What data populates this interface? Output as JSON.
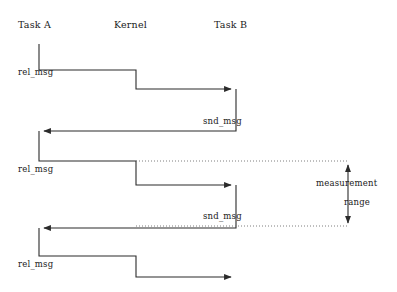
{
  "diagram": {
    "title_columns": [
      {
        "label": "Task A",
        "x": 18,
        "y": 20
      },
      {
        "label": "Kernel",
        "x": 114,
        "y": 20
      },
      {
        "label": "Task B",
        "x": 214,
        "y": 20
      }
    ],
    "lifelines": {
      "task_a_x": 39,
      "kernel_x": 136,
      "task_b_x": 236
    },
    "messages": [
      {
        "name": "rel_msg",
        "label": "rel_msg",
        "x": 18,
        "y": 67
      },
      {
        "name": "snd_msg",
        "label": "snd_msg",
        "x": 203,
        "y": 116
      },
      {
        "name": "rel_msg",
        "label": "rel_msg",
        "x": 18,
        "y": 164
      },
      {
        "name": "snd_msg",
        "label": "snd_msg",
        "x": 203,
        "y": 211
      },
      {
        "name": "rel_msg",
        "label": "rel_msg",
        "x": 18,
        "y": 259
      }
    ],
    "measurement": {
      "line1": "measurement",
      "line2": "range",
      "line1_x": 316,
      "line1_y": 178,
      "line2_x": 344,
      "line2_y": 197,
      "arrow_x": 348,
      "arrow_top_y": 161,
      "arrow_bottom_y": 227
    },
    "guides": [
      {
        "name": "dotted-guide-top",
        "y": 161,
        "x1": 136,
        "x2": 348
      },
      {
        "name": "dotted-guide-bottom",
        "y": 226,
        "x1": 136,
        "x2": 348
      }
    ],
    "colors": {
      "line": "#2b2b2b",
      "text": "#1a1a1a",
      "background": "#ffffff",
      "dotted": "#6f6f6f"
    },
    "staircase_path": "M39,44 L39,70 L136,70 L136,89 L232,89 M236,89 L236,131 L43,131 M39,131 L39,161 L136,161 L136,185 L232,185 M236,185 L236,228 L43,228 M39,228 L39,256 L136,256 L136,277 L232,277"
  }
}
